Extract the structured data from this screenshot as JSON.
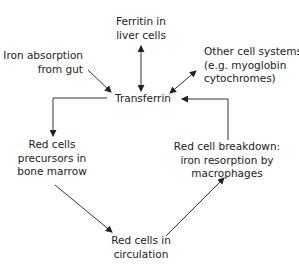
{
  "diagram": {
    "type": "iron-cycle-flow",
    "colors": {
      "text": "#222222",
      "line": "#333333",
      "background": "#ffffff"
    },
    "nodes": {
      "ferritin": {
        "lines": [
          "Ferritin in",
          "liver cells"
        ]
      },
      "absorption": {
        "lines": [
          "Iron absorption",
          "from gut"
        ]
      },
      "other": {
        "lines": [
          "Other cell systems",
          "(e.g. myoglobin",
          "cytochromes)"
        ]
      },
      "transferrin": {
        "lines": [
          "Transferrin"
        ]
      },
      "precursors": {
        "lines": [
          "Red cells",
          "precursors in",
          "bone marrow"
        ]
      },
      "breakdown": {
        "lines": [
          "Red cell breakdown:",
          "iron resorption by",
          "macrophages"
        ]
      },
      "circulation": {
        "lines": [
          "Red cells in",
          "circulation"
        ]
      }
    },
    "edges": [
      {
        "from": "ferritin",
        "to": "transferrin",
        "direction": "bidirectional"
      },
      {
        "from": "absorption",
        "to": "transferrin",
        "direction": "forward"
      },
      {
        "from": "other",
        "to": "transferrin",
        "direction": "bidirectional"
      },
      {
        "from": "transferrin",
        "to": "precursors",
        "direction": "forward",
        "style": "elbow"
      },
      {
        "from": "breakdown",
        "to": "transferrin",
        "direction": "forward",
        "style": "elbow"
      },
      {
        "from": "precursors",
        "to": "circulation",
        "direction": "forward"
      },
      {
        "from": "circulation",
        "to": "breakdown",
        "direction": "forward"
      }
    ]
  }
}
